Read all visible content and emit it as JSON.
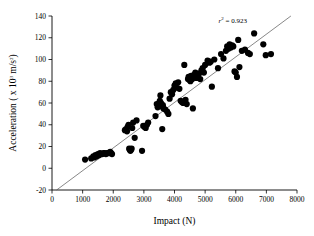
{
  "chart_data": {
    "type": "scatter",
    "title": "",
    "xlabel": "Impact (N)",
    "ylabel_full": "Acceleration ( x 10³ m/s²)",
    "ylabel_parts": {
      "pre": "Acceleration ( x 10",
      "exp1": "3",
      "mid": " m/s",
      "exp2": "2",
      "post": ")"
    },
    "xlim": [
      0,
      8000
    ],
    "ylim": [
      -20,
      140
    ],
    "xticks": [
      0,
      1000,
      2000,
      3000,
      4000,
      5000,
      6000,
      7000,
      8000
    ],
    "yticks": [
      -20,
      0,
      20,
      40,
      60,
      80,
      100,
      120,
      140
    ],
    "xticklabels": [
      "0",
      "1000",
      "2000",
      "3000",
      "4000",
      "5000",
      "6000",
      "7000",
      "8000"
    ],
    "yticklabels": [
      "-20",
      "0",
      "20",
      "40",
      "60",
      "80",
      "100",
      "120",
      "140"
    ],
    "grid": false,
    "legend": false,
    "marker": "filled-circle",
    "marker_color": "#000000",
    "marker_size_px": 3.1,
    "annotations": [
      {
        "name": "r-squared-annotation",
        "text_pre": "r",
        "text_sup": "2",
        "text_post": " = 0.923",
        "x": 5900,
        "y": 134
      }
    ],
    "fit_line": {
      "name": "linear-regression-line",
      "color": "#555555",
      "r_squared": 0.923,
      "x_start": 150,
      "y_start": -20,
      "x_end": 7800,
      "y_end": 140
    },
    "points": [
      [
        1080,
        8
      ],
      [
        1280,
        9
      ],
      [
        1350,
        11
      ],
      [
        1380,
        10
      ],
      [
        1420,
        12
      ],
      [
        1460,
        11
      ],
      [
        1500,
        13
      ],
      [
        1530,
        12
      ],
      [
        1570,
        14
      ],
      [
        1600,
        13
      ],
      [
        1640,
        13
      ],
      [
        1680,
        14
      ],
      [
        1720,
        14
      ],
      [
        1760,
        13
      ],
      [
        1800,
        14
      ],
      [
        1840,
        14
      ],
      [
        1880,
        14
      ],
      [
        1900,
        15
      ],
      [
        1930,
        14
      ],
      [
        1960,
        13
      ],
      [
        2380,
        35
      ],
      [
        2420,
        36
      ],
      [
        2450,
        34
      ],
      [
        2470,
        38
      ],
      [
        2500,
        40
      ],
      [
        2520,
        18
      ],
      [
        2540,
        17
      ],
      [
        2560,
        16
      ],
      [
        2580,
        17
      ],
      [
        2600,
        18
      ],
      [
        2620,
        37
      ],
      [
        2650,
        42
      ],
      [
        2700,
        28
      ],
      [
        2760,
        44
      ],
      [
        2940,
        16
      ],
      [
        2980,
        39
      ],
      [
        3020,
        38
      ],
      [
        3060,
        37
      ],
      [
        3100,
        40
      ],
      [
        3140,
        42
      ],
      [
        3380,
        48
      ],
      [
        3420,
        59
      ],
      [
        3450,
        56
      ],
      [
        3470,
        58
      ],
      [
        3500,
        60
      ],
      [
        3520,
        62
      ],
      [
        3540,
        67
      ],
      [
        3560,
        60
      ],
      [
        3580,
        57
      ],
      [
        3600,
        36
      ],
      [
        3620,
        58
      ],
      [
        3640,
        55
      ],
      [
        3700,
        54
      ],
      [
        3760,
        52
      ],
      [
        3800,
        50
      ],
      [
        3840,
        64
      ],
      [
        3880,
        70
      ],
      [
        3920,
        68
      ],
      [
        3960,
        72
      ],
      [
        4000,
        76
      ],
      [
        4040,
        78
      ],
      [
        4080,
        74
      ],
      [
        4120,
        79
      ],
      [
        4160,
        73
      ],
      [
        4200,
        62
      ],
      [
        4240,
        61
      ],
      [
        4280,
        60
      ],
      [
        4320,
        95
      ],
      [
        4360,
        63
      ],
      [
        4400,
        59
      ],
      [
        4440,
        82
      ],
      [
        4460,
        84
      ],
      [
        4480,
        83
      ],
      [
        4500,
        81
      ],
      [
        4520,
        80
      ],
      [
        4540,
        85
      ],
      [
        4560,
        83
      ],
      [
        4580,
        82
      ],
      [
        4600,
        55
      ],
      [
        4640,
        86
      ],
      [
        4680,
        88
      ],
      [
        4720,
        83
      ],
      [
        4760,
        84
      ],
      [
        4800,
        87
      ],
      [
        4840,
        82
      ],
      [
        4880,
        90
      ],
      [
        4920,
        92
      ],
      [
        4960,
        88
      ],
      [
        5000,
        95
      ],
      [
        5080,
        99
      ],
      [
        5140,
        97
      ],
      [
        5180,
        98
      ],
      [
        5220,
        75
      ],
      [
        5300,
        100
      ],
      [
        5420,
        92
      ],
      [
        5520,
        105
      ],
      [
        5600,
        101
      ],
      [
        5680,
        108
      ],
      [
        5720,
        112
      ],
      [
        5760,
        110
      ],
      [
        5800,
        114
      ],
      [
        5840,
        111
      ],
      [
        5880,
        113
      ],
      [
        5920,
        112
      ],
      [
        5960,
        89
      ],
      [
        6000,
        88
      ],
      [
        6040,
        84
      ],
      [
        6080,
        118
      ],
      [
        6120,
        93
      ],
      [
        6200,
        108
      ],
      [
        6300,
        109
      ],
      [
        6400,
        106
      ],
      [
        6460,
        105
      ],
      [
        6600,
        124
      ],
      [
        6900,
        114
      ],
      [
        6980,
        104
      ],
      [
        7150,
        105
      ]
    ]
  }
}
